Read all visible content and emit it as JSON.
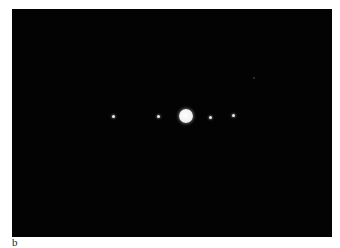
{
  "figure": {
    "panel_label": "b",
    "background_color": "#030303",
    "planet": {
      "name": "Jupiter",
      "cx": 174,
      "cy": 107,
      "r": 7
    },
    "moons": [
      {
        "x": 101,
        "y": 107
      },
      {
        "x": 146,
        "y": 107
      },
      {
        "x": 198,
        "y": 108
      },
      {
        "x": 221,
        "y": 106
      }
    ],
    "faint_objects": [
      {
        "x": 241,
        "y": 68
      }
    ]
  }
}
